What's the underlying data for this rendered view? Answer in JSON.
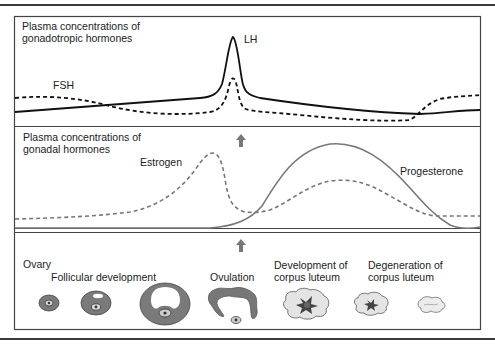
{
  "panels": {
    "top": {
      "title_line1": "Plasma concentrations of",
      "title_line2": "gonadotropic hormones",
      "series": [
        {
          "name": "LH",
          "style": "solid",
          "color": "#111111"
        },
        {
          "name": "FSH",
          "style": "dashed",
          "color": "#111111"
        }
      ]
    },
    "middle": {
      "title_line1": "Plasma concentrations of",
      "title_line2": "gonadal hormones",
      "series": [
        {
          "name": "Estrogen",
          "style": "dashed",
          "color": "#777777"
        },
        {
          "name": "Progesterone",
          "style": "solid",
          "color": "#777777"
        }
      ]
    },
    "bottom": {
      "title": "Ovary",
      "stages": [
        {
          "label": "Follicular development"
        },
        {
          "label": "Ovulation"
        },
        {
          "label_line1": "Development of",
          "label_line2": "corpus luteum"
        },
        {
          "label_line1": "Degeneration of",
          "label_line2": "corpus luteum"
        }
      ]
    }
  },
  "colors": {
    "frame": "#444444",
    "follicle_gray": "#7a7a7a",
    "luteum_fill": "#e4e4e4",
    "arrow": "#777777"
  }
}
